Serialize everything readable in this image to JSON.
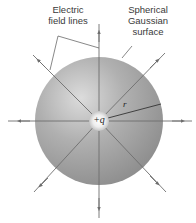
{
  "figure": {
    "labels": {
      "field_lines": [
        "Electric",
        "field lines"
      ],
      "surface": [
        "Spherical",
        "Gaussian",
        "surface"
      ],
      "charge": "+q",
      "radius": "r"
    },
    "colors": {
      "background": "#ffffff",
      "sphere_highlight": "#d9d9d9",
      "sphere_mid": "#a9a9a9",
      "sphere_shadow": "#8a8a8a",
      "field_line": "#6e6e6e",
      "charge_glow": "#f2f2f2",
      "text": "#3a3a3a"
    },
    "geometry": {
      "center": [
        99,
        121
      ],
      "sphere_radius": 64,
      "charge_radius": 10,
      "field_line_count": 8
    }
  }
}
